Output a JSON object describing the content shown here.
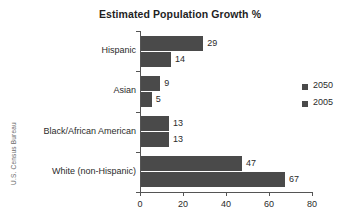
{
  "chart_data": {
    "type": "bar",
    "orientation": "horizontal",
    "title": "Estimated Population Growth %",
    "xlabel": "",
    "ylabel": "",
    "xlim": [
      0,
      80
    ],
    "xticks": [
      0,
      20,
      40,
      60,
      80
    ],
    "grid": false,
    "legend_position": "right",
    "categories": [
      "Hispanic",
      "Asian",
      "Black/African American",
      "White (non-Hispanic)"
    ],
    "series": [
      {
        "name": "2050",
        "values": [
          29,
          9,
          13,
          47
        ],
        "color": "#4a4a4a"
      },
      {
        "name": "2005",
        "values": [
          14,
          5,
          13,
          67
        ],
        "color": "#4a4a4a"
      }
    ],
    "annotations": [
      "U.S. Census Bureau"
    ]
  },
  "source": {
    "text": "U.S. Census Bureau"
  },
  "axis": {
    "tick_labels": [
      "0",
      "20",
      "40",
      "60",
      "80"
    ]
  },
  "legend": {
    "items": [
      {
        "label": "2050"
      },
      {
        "label": "2005"
      }
    ]
  }
}
